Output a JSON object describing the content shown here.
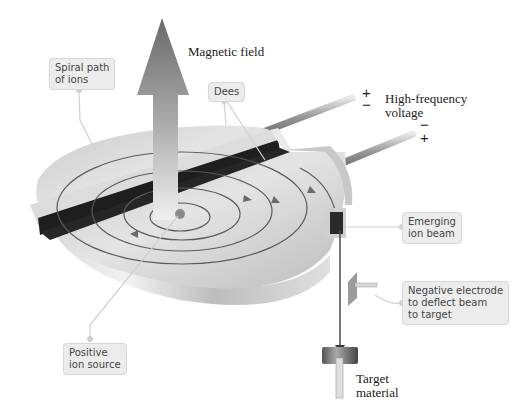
{
  "figure": {
    "labels": {
      "magnetic_field": "Magnetic field",
      "high_frequency_voltage": [
        "High-frequency",
        "voltage"
      ],
      "target_material": [
        "Target",
        "material"
      ]
    },
    "callouts": {
      "spiral_path": [
        "Spiral path",
        "of ions"
      ],
      "dees": [
        "Dees"
      ],
      "emerging_beam": [
        "Emerging",
        "ion beam"
      ],
      "negative_electrode": [
        "Negative electrode",
        "to deflect beam",
        "to target"
      ],
      "ion_source": [
        "Positive",
        "ion source"
      ]
    },
    "polarity": {
      "upper_terminal": [
        "+",
        "−"
      ],
      "lower_terminal": [
        "−",
        "+"
      ]
    },
    "colors": {
      "background": "#ffffff",
      "callout_bg": "#ececec",
      "leader_line": "#d0d0d0",
      "dee_light": "#e6e6e6",
      "dee_mid": "#b8b8b8",
      "gap_dark": "#1e1e1e",
      "path_line": "#5a5a5a"
    }
  }
}
